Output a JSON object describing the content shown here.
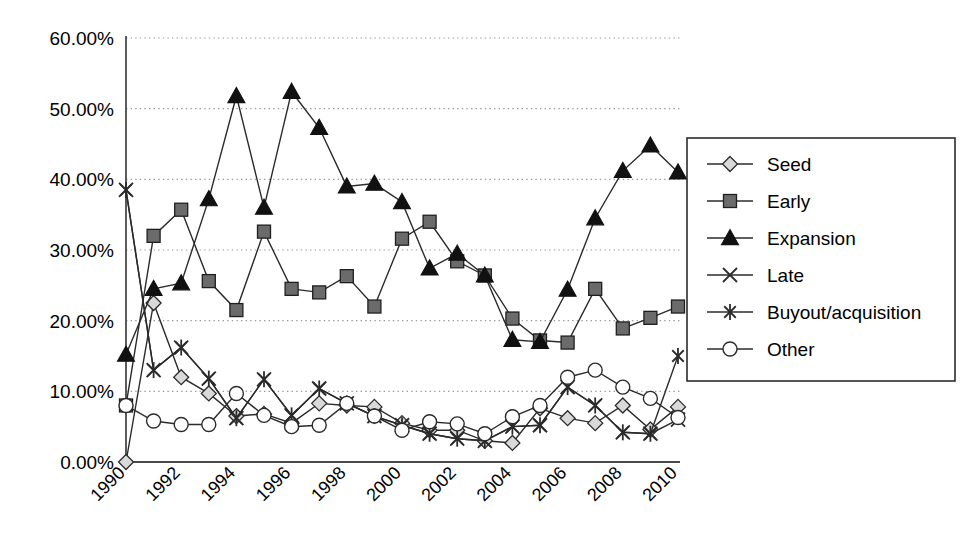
{
  "chart_data": {
    "type": "line",
    "title": "",
    "xlabel": "",
    "ylabel": "",
    "grid": true,
    "legend_position": "right",
    "ylim": [
      0,
      60
    ],
    "ytick_labels": [
      "60.00%",
      "50.00%",
      "40.00%",
      "30.00%",
      "20.00%",
      "10.00%",
      "0.00%"
    ],
    "ytick_values": [
      60,
      50,
      40,
      30,
      20,
      10,
      0
    ],
    "x": [
      1990,
      1991,
      1992,
      1993,
      1994,
      1995,
      1996,
      1997,
      1998,
      1999,
      2000,
      2001,
      2002,
      2003,
      2004,
      2005,
      2006,
      2007,
      2008,
      2009,
      2010
    ],
    "xtick_labels": [
      "1990",
      "1992",
      "1994",
      "1996",
      "1998",
      "2000",
      "2002",
      "2004",
      "2006",
      "2008",
      "2010"
    ],
    "xtick_values": [
      1990,
      1992,
      1994,
      1996,
      1998,
      2000,
      2002,
      2004,
      2006,
      2008,
      2010
    ],
    "series": [
      {
        "name": "Seed",
        "marker": "diamond",
        "marker_fill": "#d9d9d9",
        "values": [
          0.0,
          22.5,
          12.0,
          9.7,
          6.5,
          6.8,
          5.5,
          8.3,
          8.0,
          7.8,
          5.5,
          4.5,
          4.5,
          3.0,
          2.7,
          7.6,
          6.2,
          5.5,
          8.0,
          4.6,
          7.8
        ]
      },
      {
        "name": "Early",
        "marker": "square",
        "marker_fill": "#6b6b6b",
        "values": [
          8.0,
          32.0,
          35.7,
          25.6,
          21.5,
          32.6,
          24.5,
          24.0,
          26.3,
          22.0,
          31.6,
          34.0,
          28.4,
          26.4,
          20.3,
          17.2,
          16.9,
          24.5,
          18.9,
          20.4,
          22.0
        ]
      },
      {
        "name": "Expansion",
        "marker": "triangle",
        "marker_fill": "#111111",
        "values": [
          15.2,
          24.5,
          25.3,
          37.2,
          51.8,
          36.0,
          52.4,
          47.3,
          39.0,
          39.4,
          36.8,
          27.4,
          29.5,
          26.4,
          17.3,
          17.0,
          24.4,
          34.5,
          41.2,
          44.8,
          41.0
        ]
      },
      {
        "name": "Late",
        "marker": "x",
        "marker_fill": "none",
        "values": [
          38.5,
          13.0,
          16.2,
          11.8,
          6.2,
          11.7,
          6.6,
          10.4,
          8.3,
          6.5,
          5.2,
          4.0,
          3.3,
          3.0,
          5.0,
          5.2,
          10.6,
          8.0,
          4.2,
          4.0,
          6.0
        ]
      },
      {
        "name": "Buyout/acquisition",
        "marker": "asterisk",
        "marker_fill": "none",
        "values": [
          38.5,
          13.0,
          16.2,
          11.8,
          6.2,
          11.7,
          6.6,
          10.4,
          8.3,
          6.5,
          5.2,
          4.0,
          3.3,
          3.0,
          5.0,
          5.2,
          10.6,
          8.0,
          4.2,
          4.0,
          15.0
        ]
      },
      {
        "name": "Other",
        "marker": "circle",
        "marker_fill": "#ffffff",
        "values": [
          8.0,
          5.8,
          5.3,
          5.3,
          9.7,
          6.6,
          5.0,
          5.2,
          8.3,
          6.5,
          4.5,
          5.7,
          5.4,
          4.0,
          6.4,
          8.0,
          12.0,
          13.0,
          10.6,
          9.0,
          6.3
        ]
      }
    ]
  },
  "legend": {
    "items": [
      {
        "label": "Seed"
      },
      {
        "label": "Early"
      },
      {
        "label": "Expansion"
      },
      {
        "label": "Late"
      },
      {
        "label": "Buyout/acquisition"
      },
      {
        "label": "Other"
      }
    ]
  },
  "colors": {
    "line": "#2b2b2b",
    "grid": "#9a9a9a",
    "axis": "#4a4a4a",
    "seed_fill": "#d9d9d9",
    "early_fill": "#6b6b6b",
    "expansion_fill": "#111111",
    "other_fill": "#ffffff"
  }
}
